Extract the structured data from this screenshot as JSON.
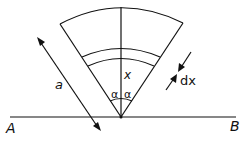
{
  "diagram": {
    "labels": {
      "a": "a",
      "x": "x",
      "alpha_left": "α",
      "alpha_right": "α",
      "dx": "dx",
      "A": "A",
      "B": "B"
    },
    "elements": [
      "sector with apex on line AB",
      "half-angle α on each side of vertical axis",
      "thin annular strip at distance x of width dx",
      "double arrow of length a along left side"
    ]
  }
}
